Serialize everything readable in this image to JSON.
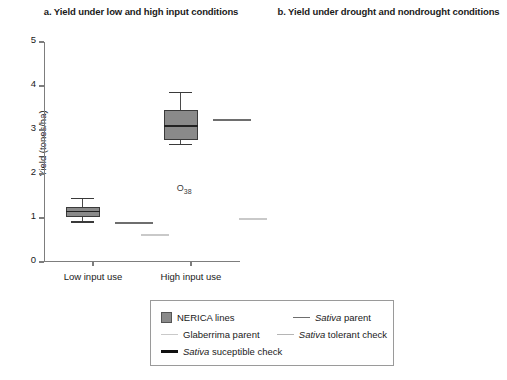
{
  "figure": {
    "background": "#ffffff"
  },
  "colors": {
    "nerica_fill": "#8a8a8a",
    "nerica_edge": "#3a3a3a",
    "sativa_parent": "#6e6e6e",
    "glaberrima_parent": "#c9c9c9",
    "sativa_tolerant_check": "#b5b5b5",
    "sativa_suceptible_check": "#111111",
    "axis": "#7d7d7d",
    "text": "#1a1a1a"
  },
  "legend": {
    "items": [
      {
        "label": "NERICA lines",
        "label_italic": "",
        "swatch": "filled-square",
        "color": "#8a8a8a"
      },
      {
        "label": " parent",
        "label_italic": "Sativa",
        "swatch": "line",
        "color": "#6e6e6e"
      },
      {
        "label": "Glaberrima parent",
        "label_italic": "",
        "swatch": "line",
        "color": "#c9c9c9"
      },
      {
        "label": " tolerant check",
        "label_italic": "Sativa",
        "swatch": "line",
        "color": "#b5b5b5"
      },
      {
        "label": " suceptible check",
        "label_italic": "Sativa",
        "swatch": "thick-line",
        "color": "#111111"
      }
    ]
  },
  "chart_data": [
    {
      "type": "box",
      "panel": "a",
      "title": "a. Yield under low and high input conditions",
      "xlabel": "",
      "ylabel": "Yield (tones/ha)",
      "ylim": [
        0,
        5
      ],
      "yticks": [
        0,
        1,
        2,
        3,
        4,
        5
      ],
      "ytick_labels": [
        "0",
        "1",
        "2",
        "3",
        "4",
        "5"
      ],
      "grid": false,
      "categories": [
        "Low input use",
        "High input use"
      ],
      "boxes": [
        {
          "category": "Low input use",
          "series": "NERICA lines",
          "whisker_low": 0.91,
          "q1": 1.02,
          "median": 1.15,
          "q3": 1.26,
          "whisker_high": 1.45
        },
        {
          "category": "High input use",
          "series": "NERICA lines",
          "whisker_low": 2.67,
          "q1": 2.78,
          "median": 3.09,
          "q3": 3.45,
          "whisker_high": 3.85,
          "outliers": [
            {
              "label": "O",
              "sublabel": "38",
              "value": 1.65
            }
          ]
        }
      ],
      "reference_lines": [
        {
          "category": "Low input use",
          "series": "Sativa parent",
          "value": 0.88
        },
        {
          "category": "Low input use",
          "series": "Glaberrima parent",
          "value": 0.62
        },
        {
          "category": "High input use",
          "series": "Sativa parent",
          "value": 3.22
        },
        {
          "category": "High input use",
          "series": "Glaberrima parent",
          "value": 0.97
        }
      ]
    },
    {
      "type": "box",
      "panel": "b",
      "title": "b. Yield under drought and nondrought conditions",
      "xlabel": "",
      "ylabel": "Yield (tones/ha)",
      "ylim": [
        0,
        3.0
      ],
      "yticks": [
        0,
        0.5,
        1.0,
        1.5,
        2.0,
        2.5,
        3.0
      ],
      "ytick_labels": [
        "0",
        "0.5",
        "1.0",
        "1.5",
        "2.0",
        "2.5",
        "3.0"
      ],
      "grid": false,
      "categories": [
        "Nondrought site",
        "Drought site"
      ],
      "boxes": [
        {
          "category": "Nondrought site",
          "series": "NERICA lines",
          "whisker_low": 1.49,
          "q1": 1.76,
          "median": 2.05,
          "q3": 2.33,
          "whisker_high": 2.65
        },
        {
          "category": "Drought site",
          "series": "NERICA lines",
          "whisker_low": 1.05,
          "q1": 1.25,
          "median": 1.6,
          "q3": 1.83,
          "whisker_high": 2.26
        }
      ],
      "reference_lines": [
        {
          "category": "Nondrought site",
          "series": "Sativa parent",
          "value": 1.96
        },
        {
          "category": "Nondrought site",
          "series": "Sativa tolerant check",
          "value": 1.96
        },
        {
          "category": "Nondrought site",
          "series": "Sativa suceptible check",
          "value": 1.1
        },
        {
          "category": "Nondrought site",
          "series": "Glaberrima parent",
          "value": 0.85
        },
        {
          "category": "Drought site",
          "series": "Sativa parent",
          "value": 1.17
        },
        {
          "category": "Drought site",
          "series": "Glaberrima parent",
          "value": 1.22
        },
        {
          "category": "Drought site",
          "series": "Sativa tolerant check",
          "value": 1.49
        },
        {
          "category": "Drought site",
          "series": "Sativa suceptible check",
          "value": 0.47
        }
      ]
    }
  ]
}
